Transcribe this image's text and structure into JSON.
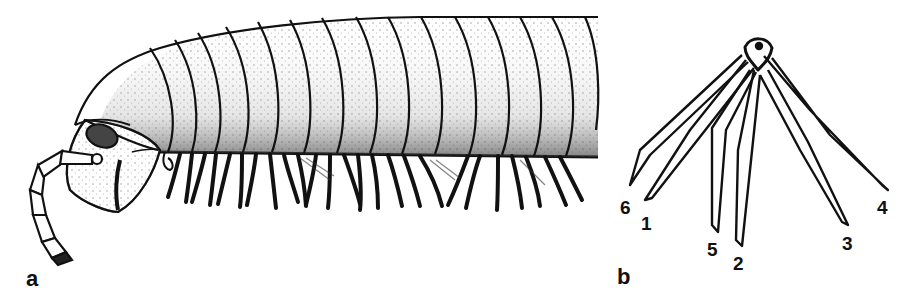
{
  "figure": {
    "panels": [
      {
        "id": "a",
        "label": "a",
        "subject": "millipede-lateral-view"
      },
      {
        "id": "b",
        "label": "b",
        "subject": "radiating-appendages"
      }
    ],
    "panel_b_labels": [
      "6",
      "1",
      "5",
      "2",
      "3",
      "4"
    ],
    "colors": {
      "ink": "#111111",
      "background": "#ffffff",
      "stipple": "#555555"
    }
  }
}
